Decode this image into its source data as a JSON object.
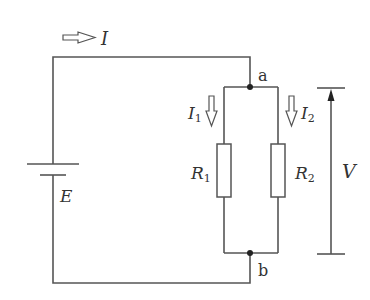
{
  "diagram": {
    "type": "circuit",
    "colors": {
      "wire": "#555555",
      "text": "#333333",
      "background": "#ffffff"
    },
    "labels": {
      "total_current": "I",
      "branch1_current": "I",
      "branch1_current_sub": "1",
      "branch2_current": "I",
      "branch2_current_sub": "2",
      "resistor1": "R",
      "resistor1_sub": "1",
      "resistor2": "R",
      "resistor2_sub": "2",
      "emf": "E",
      "voltage": "V",
      "node_top": "a",
      "node_bottom": "b"
    },
    "components": [
      {
        "id": "battery",
        "symbol": "battery-icon",
        "label": "E"
      },
      {
        "id": "R1",
        "symbol": "resistor-icon",
        "label": "R1"
      },
      {
        "id": "R2",
        "symbol": "resistor-icon",
        "label": "R2"
      }
    ],
    "nodes": [
      "a",
      "b"
    ],
    "arrows": [
      {
        "id": "I",
        "direction": "right",
        "style": "hollow"
      },
      {
        "id": "I1",
        "direction": "down",
        "style": "hollow"
      },
      {
        "id": "I2",
        "direction": "down",
        "style": "hollow"
      },
      {
        "id": "V",
        "direction": "up",
        "style": "solid",
        "span": "b to a"
      }
    ]
  }
}
